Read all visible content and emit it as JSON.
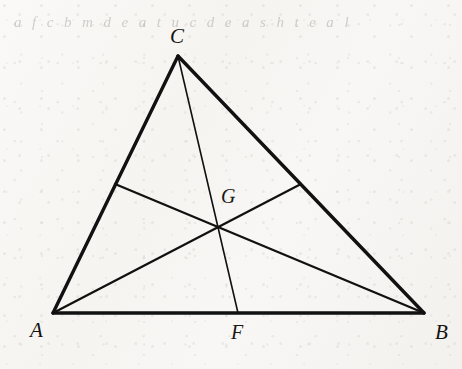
{
  "figure": {
    "kind": "euclidean-geometry-diagram",
    "caption_text": "",
    "background_color": "#f7f6f4",
    "ink_color": "#111111",
    "bleed_through_text": "a f c b m d e a t u c d e a s h t e a l",
    "labels": {
      "vertex_a": "A",
      "vertex_b": "B",
      "vertex_c": "C",
      "centroid_g": "G",
      "foot_f": "F"
    },
    "label_positions": {
      "vertex_a": {
        "x": 30,
        "y": 320
      },
      "vertex_b": {
        "x": 435,
        "y": 322
      },
      "vertex_c": {
        "x": 170,
        "y": 26
      },
      "centroid_g": {
        "x": 221,
        "y": 186
      },
      "foot_f": {
        "x": 231,
        "y": 322
      }
    },
    "points": {
      "A": {
        "x": 53,
        "y": 313
      },
      "B": {
        "x": 424,
        "y": 313
      },
      "C": {
        "x": 178,
        "y": 56
      },
      "F": {
        "x": 238,
        "y": 313
      },
      "D": {
        "x": 301,
        "y": 184
      },
      "E": {
        "x": 115,
        "y": 184
      },
      "G": {
        "x": 218,
        "y": 222
      }
    },
    "segments": [
      {
        "name": "side-AB",
        "from": "A",
        "to": "B",
        "width": 3.4,
        "role": "triangle-side"
      },
      {
        "name": "side-AC",
        "from": "A",
        "to": "C",
        "width": 3.4,
        "role": "triangle-side"
      },
      {
        "name": "side-CB",
        "from": "C",
        "to": "B",
        "width": 3.4,
        "role": "triangle-side"
      },
      {
        "name": "median-CF",
        "from": "C",
        "to": "F",
        "width": 1.6,
        "role": "median"
      },
      {
        "name": "median-AD",
        "from": "A",
        "to": "D",
        "width": 2.3,
        "role": "median"
      },
      {
        "name": "median-BE",
        "from": "B",
        "to": "E",
        "width": 2.3,
        "role": "median"
      }
    ]
  }
}
